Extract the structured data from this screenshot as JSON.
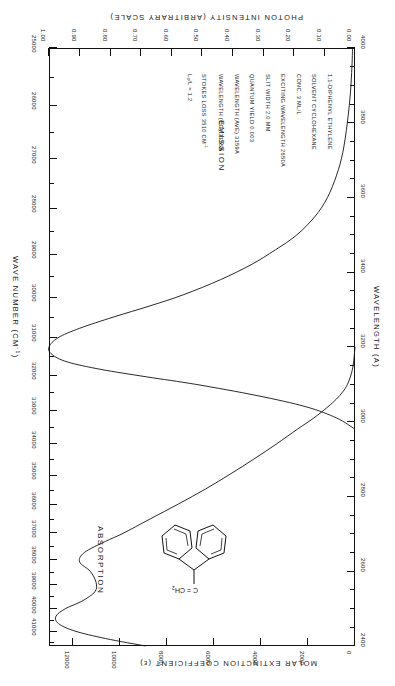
{
  "chart_data": {
    "type": "line",
    "orientation": "rotated-180",
    "axes": {
      "wavelength": {
        "label": "WAVELENGTH  (A)",
        "unit": "angstrom",
        "min": 2400,
        "max": 4000,
        "major_ticks": [
          2400,
          2600,
          2800,
          3000,
          3200,
          3400,
          3600,
          3800,
          4000
        ],
        "minor_step": 50
      },
      "wavenumber": {
        "label": "WAVE NUMBER  (CM",
        "label_sup": "-1",
        "label_tail": ")",
        "unit": "cm^-1",
        "min": 25000,
        "max": 42000,
        "major_ticks": [
          25000,
          26000,
          27000,
          28000,
          29000,
          30000,
          31000,
          32000,
          33000,
          34000,
          35000,
          36000,
          37000,
          38000,
          39000,
          40000,
          41000,
          42000
        ]
      },
      "photon_intensity": {
        "label": "PHOTON INTENSITY (ARBITRARY SCALE)",
        "min": 0.0,
        "max": 1.0,
        "major_ticks": [
          "0.00",
          "0.10",
          "0.20",
          "0.30",
          "0.40",
          "0.50",
          "0.60",
          "0.70",
          "0.80",
          "0.90",
          "1.00"
        ]
      },
      "molar_extinction": {
        "label": "MOLAR EXTINCTION COEFFICIENT  (",
        "label_sym": "ε",
        "label_tail": ")",
        "min": 0,
        "max": 13000,
        "major_ticks": [
          0,
          2000,
          4000,
          6000,
          8000,
          10000,
          12000
        ]
      }
    },
    "series": [
      {
        "name": "ABSORPTION",
        "x_axis": "molar_extinction",
        "y_axis": "wavelength",
        "points_wavelength_epsilon": [
          [
            2400,
            8900
          ],
          [
            2420,
            10600
          ],
          [
            2440,
            11900
          ],
          [
            2460,
            12600
          ],
          [
            2480,
            12700
          ],
          [
            2500,
            12300
          ],
          [
            2520,
            11600
          ],
          [
            2545,
            11050
          ],
          [
            2570,
            11000
          ],
          [
            2600,
            11250
          ],
          [
            2625,
            11700
          ],
          [
            2650,
            11500
          ],
          [
            2680,
            10600
          ],
          [
            2700,
            9900
          ],
          [
            2740,
            8700
          ],
          [
            2780,
            7500
          ],
          [
            2820,
            6350
          ],
          [
            2860,
            5300
          ],
          [
            2900,
            4300
          ],
          [
            2940,
            3350
          ],
          [
            2980,
            2450
          ],
          [
            3010,
            1750
          ],
          [
            3040,
            1150
          ],
          [
            3060,
            800
          ],
          [
            3080,
            520
          ],
          [
            3100,
            320
          ],
          [
            3130,
            150
          ],
          [
            3160,
            60
          ],
          [
            3200,
            0
          ]
        ]
      },
      {
        "name": "EMISSION",
        "x_axis": "photon_intensity",
        "y_axis": "wavelength",
        "points_wavelength_intensity": [
          [
            2980,
            0.0
          ],
          [
            3010,
            0.06
          ],
          [
            3040,
            0.16
          ],
          [
            3070,
            0.32
          ],
          [
            3100,
            0.52
          ],
          [
            3120,
            0.68
          ],
          [
            3140,
            0.83
          ],
          [
            3160,
            0.94
          ],
          [
            3180,
            0.99
          ],
          [
            3200,
            1.0
          ],
          [
            3225,
            0.97
          ],
          [
            3250,
            0.9
          ],
          [
            3280,
            0.79
          ],
          [
            3310,
            0.67
          ],
          [
            3340,
            0.56
          ],
          [
            3380,
            0.44
          ],
          [
            3420,
            0.34
          ],
          [
            3460,
            0.26
          ],
          [
            3500,
            0.19
          ],
          [
            3550,
            0.13
          ],
          [
            3600,
            0.09
          ],
          [
            3660,
            0.06
          ],
          [
            3720,
            0.04
          ],
          [
            3800,
            0.025
          ],
          [
            3880,
            0.015
          ],
          [
            3950,
            0.01
          ],
          [
            4000,
            0.008
          ]
        ]
      }
    ],
    "curve_labels": {
      "absorption": "ABSORPTION",
      "emission": "EMISSION"
    },
    "annotations": [
      "1,1-DIPHENYL ETHYLENE",
      "SOLVENT  CYCLOHEXANE",
      "CONC.  3 ML/L",
      "EXCITING WAVELENGTH  2650A",
      "SLIT WIDTH  2.0 MM",
      "QUANTUM YIELD  0.003",
      "WAVELENGTH (AVE)  3159A",
      "WAVELENGTH (CG)  3175A",
      "STOKES LOSS  3510 CM",
      "L₀/L = 1.2"
    ],
    "annotation_superscripts": {
      "stokes_loss_sup": "-1"
    },
    "molecule": {
      "name": "1,1-diphenyl ethylene",
      "center_label": "C = CH",
      "center_sub": "2",
      "rings": 2
    },
    "grid": false,
    "legend": "none"
  }
}
